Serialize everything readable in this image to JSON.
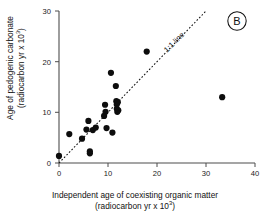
{
  "panel": {
    "letter": "B"
  },
  "axes": {
    "x": {
      "title_line1": "Independent age of coexisting organic matter",
      "title_line2_pre": "(radiocarbon yr x 10",
      "title_line2_sup": "3",
      "title_line2_post": ")",
      "ticks": [
        "0",
        "10",
        "20",
        "30",
        "40"
      ]
    },
    "y": {
      "title_line1": "Age of pedogenic carbonate",
      "title_line2_pre": "(radiocarbon yr x 10",
      "title_line2_sup": "3",
      "title_line2_post": ")",
      "ticks": [
        "0",
        "10",
        "20",
        "30"
      ]
    }
  },
  "annotations": {
    "reference_line_label": "1:1 line"
  },
  "chart_data": {
    "type": "scatter",
    "title": "",
    "xlabel": "Independent age of coexisting organic matter (radiocarbon yr x 10^3)",
    "ylabel": "Age of pedogenic carbonate (radiocarbon yr x 10^3)",
    "xlim": [
      0,
      40
    ],
    "ylim": [
      0,
      30
    ],
    "xticks": [
      0,
      10,
      20,
      30,
      40
    ],
    "yticks": [
      0,
      10,
      20,
      30
    ],
    "grid": false,
    "legend": null,
    "reference_line": {
      "label": "1:1 line",
      "style": "dotted",
      "from": [
        0,
        0
      ],
      "to": [
        30,
        30
      ]
    },
    "points": [
      [
        0.0,
        1.4
      ],
      [
        2.1,
        5.7
      ],
      [
        4.7,
        4.8
      ],
      [
        5.6,
        6.6
      ],
      [
        6.0,
        8.3
      ],
      [
        6.3,
        2.3
      ],
      [
        6.3,
        1.9
      ],
      [
        6.9,
        6.5
      ],
      [
        7.5,
        7.0
      ],
      [
        9.2,
        9.3
      ],
      [
        9.4,
        11.5
      ],
      [
        9.5,
        10.1
      ],
      [
        9.7,
        6.9
      ],
      [
        10.6,
        17.8
      ],
      [
        10.9,
        6.0
      ],
      [
        11.6,
        15.2
      ],
      [
        11.7,
        12.2
      ],
      [
        11.8,
        11.6
      ],
      [
        11.8,
        10.7
      ],
      [
        11.9,
        10.1
      ],
      [
        12.0,
        12.0
      ],
      [
        12.1,
        10.4
      ],
      [
        17.9,
        22.0
      ],
      [
        33.3,
        13.0
      ]
    ]
  }
}
